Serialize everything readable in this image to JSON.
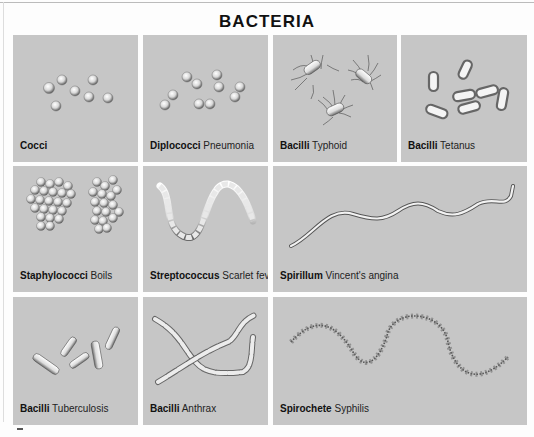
{
  "title": "BACTERIA",
  "panels": [
    {
      "id": "cocci",
      "name": "Cocci",
      "disease": ""
    },
    {
      "id": "diplococci",
      "name": "Diplococci",
      "disease": "Pneumonia"
    },
    {
      "id": "bacilli-typhoid",
      "name": "Bacilli",
      "disease": "Typhoid"
    },
    {
      "id": "bacilli-tetanus",
      "name": "Bacilli",
      "disease": "Tetanus"
    },
    {
      "id": "staphylococci",
      "name": "Staphylococci",
      "disease": "Boils"
    },
    {
      "id": "streptococcus",
      "name": "Streptococcus",
      "disease": "Scarlet fever"
    },
    {
      "id": "spirillum",
      "name": "Spirillum",
      "disease": "Vincent's angina"
    },
    {
      "id": "bacilli-tuberculosis",
      "name": "Bacilli",
      "disease": "Tuberculosis"
    },
    {
      "id": "bacilli-anthrax",
      "name": "Bacilli",
      "disease": "Anthrax"
    },
    {
      "id": "spirochete",
      "name": "Spirochete",
      "disease": "Syphilis"
    }
  ],
  "colors": {
    "panel_bg": "#c6c6c6",
    "text": "#111111",
    "cell_fill": "#f2f2f2",
    "cell_shade": "#7a7a7a"
  }
}
